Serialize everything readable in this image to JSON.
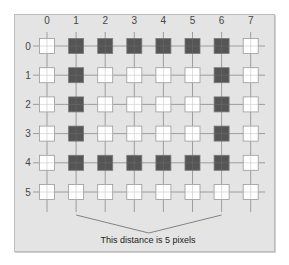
{
  "diagram": {
    "title": "",
    "columns": [
      "0",
      "1",
      "2",
      "3",
      "4",
      "5",
      "6",
      "7"
    ],
    "rows": [
      "0",
      "1",
      "2",
      "3",
      "4",
      "5"
    ],
    "grid": [
      [
        0,
        1,
        1,
        1,
        1,
        1,
        1,
        0
      ],
      [
        0,
        1,
        0,
        0,
        0,
        0,
        1,
        0
      ],
      [
        0,
        1,
        0,
        0,
        0,
        0,
        1,
        0
      ],
      [
        0,
        1,
        0,
        0,
        0,
        0,
        1,
        0
      ],
      [
        0,
        1,
        1,
        1,
        1,
        1,
        1,
        0
      ],
      [
        0,
        0,
        0,
        0,
        0,
        0,
        0,
        0
      ]
    ],
    "legend": {
      "filled": "dark pixel",
      "empty": "white pixel"
    },
    "annotation": {
      "text": "This distance is 5 pixels",
      "from_column": 1,
      "to_column": 6
    },
    "colors": {
      "background": "#e4e4e4",
      "filled": "#555555",
      "empty": "#ffffff",
      "gridline": "#8a8a8a",
      "cell_border": "#9a9a9a"
    }
  }
}
